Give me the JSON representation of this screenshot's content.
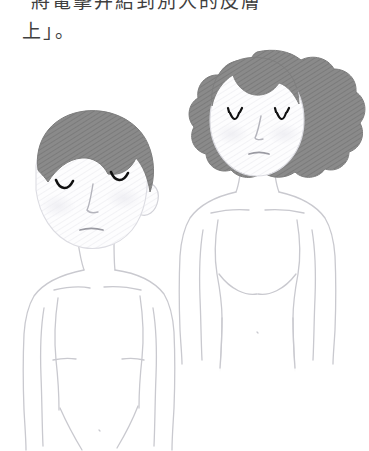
{
  "page": {
    "background_color": "#ffffff",
    "width": 369,
    "height": 451
  },
  "text": {
    "line1": "將電擊并結到別人的皮膚",
    "line2": "上」。",
    "color": "#3f3f3f"
  },
  "illustration": {
    "caption_alt": "Two line-drawn figures: a short-haired person on the left with head tilted and eyes closed, and a curly-haired person on the right with eyes closed",
    "outline_color": "#c9c9cf",
    "hair_color": "#8a8a8a",
    "hair_shade_color": "#7d7d7d",
    "skin_color": "#fcfcfd",
    "feature_color": "#101010",
    "figures": [
      {
        "name": "left-figure",
        "hair_style": "short",
        "eyes": "closed",
        "mouth": "neutral-line",
        "head_tilt": "left"
      },
      {
        "name": "right-figure",
        "hair_style": "curly",
        "eyes": "closed-with-lashes",
        "mouth": "neutral-line",
        "head_tilt": "none"
      }
    ]
  }
}
